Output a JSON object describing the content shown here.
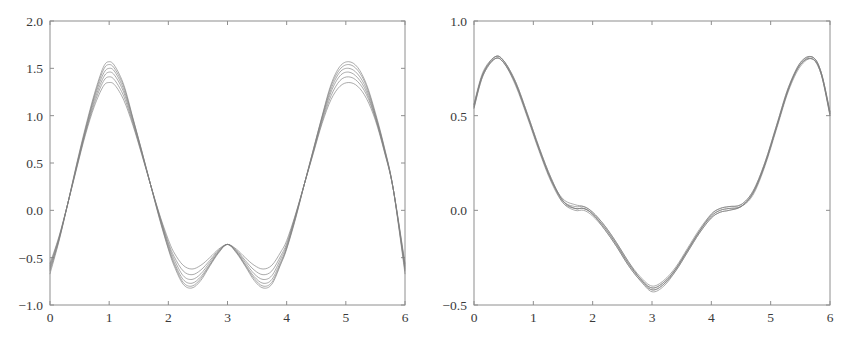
{
  "figure": {
    "background_color": "#ffffff",
    "curve_color": "#808080",
    "axis_color": "#8e8e8e",
    "tick_label_color": "#3a3a3a",
    "panel_count": 2
  },
  "chart_data": [
    {
      "type": "line",
      "title": "",
      "subtitle": "",
      "xlabel": "",
      "ylabel": "",
      "xlim": [
        0,
        6
      ],
      "ylim": [
        -1.0,
        2.0
      ],
      "xticks": [
        0,
        1,
        2,
        3,
        4,
        5,
        6
      ],
      "xtick_labels": [
        "0",
        "1",
        "2",
        "3",
        "4",
        "5",
        "6"
      ],
      "yticks": [
        -1.0,
        -0.5,
        0.0,
        0.5,
        1.0,
        1.5,
        2.0
      ],
      "ytick_labels": [
        "-1.0",
        "-0.5",
        "0.0",
        "0.5",
        "1.0",
        "1.5",
        "2.0"
      ],
      "grid": false,
      "legend": null,
      "legend_position": "none",
      "annotations": [],
      "x": [
        0.0,
        0.15,
        0.3,
        0.45,
        0.6,
        0.75,
        0.9,
        1.0,
        1.1,
        1.25,
        1.4,
        1.55,
        1.7,
        1.85,
        2.0,
        2.1,
        2.25,
        2.4,
        2.55,
        2.7,
        2.85,
        3.0,
        3.15,
        3.3,
        3.45,
        3.6,
        3.75,
        3.9,
        4.0,
        4.15,
        4.3,
        4.45,
        4.6,
        4.75,
        4.9,
        5.05,
        5.2,
        5.35,
        5.5,
        5.65,
        5.8,
        6.0
      ],
      "series": [
        {
          "name": "curve-1",
          "values": [
            -0.56,
            -0.28,
            0.07,
            0.44,
            0.8,
            1.1,
            1.31,
            1.35,
            1.32,
            1.16,
            0.9,
            0.59,
            0.27,
            -0.04,
            -0.31,
            -0.45,
            -0.58,
            -0.62,
            -0.58,
            -0.5,
            -0.41,
            -0.36,
            -0.41,
            -0.5,
            -0.58,
            -0.62,
            -0.58,
            -0.44,
            -0.32,
            -0.04,
            0.28,
            0.6,
            0.92,
            1.17,
            1.31,
            1.35,
            1.31,
            1.18,
            0.95,
            0.62,
            0.23,
            -0.56
          ]
        },
        {
          "name": "curve-2",
          "values": [
            -0.58,
            -0.29,
            0.07,
            0.45,
            0.82,
            1.13,
            1.36,
            1.41,
            1.37,
            1.2,
            0.92,
            0.6,
            0.27,
            -0.05,
            -0.34,
            -0.49,
            -0.64,
            -0.68,
            -0.63,
            -0.53,
            -0.42,
            -0.36,
            -0.42,
            -0.53,
            -0.63,
            -0.68,
            -0.64,
            -0.48,
            -0.35,
            -0.05,
            0.28,
            0.61,
            0.94,
            1.21,
            1.37,
            1.41,
            1.36,
            1.22,
            0.97,
            0.63,
            0.23,
            -0.58
          ]
        },
        {
          "name": "curve-3",
          "values": [
            -0.6,
            -0.3,
            0.07,
            0.46,
            0.83,
            1.16,
            1.4,
            1.46,
            1.42,
            1.24,
            0.94,
            0.61,
            0.27,
            -0.06,
            -0.36,
            -0.52,
            -0.69,
            -0.73,
            -0.67,
            -0.55,
            -0.43,
            -0.36,
            -0.43,
            -0.55,
            -0.67,
            -0.73,
            -0.69,
            -0.51,
            -0.37,
            -0.06,
            0.28,
            0.62,
            0.96,
            1.25,
            1.42,
            1.46,
            1.4,
            1.25,
            0.98,
            0.64,
            0.23,
            -0.6
          ]
        },
        {
          "name": "curve-4",
          "values": [
            -0.62,
            -0.31,
            0.07,
            0.47,
            0.85,
            1.19,
            1.44,
            1.5,
            1.46,
            1.27,
            0.96,
            0.62,
            0.27,
            -0.07,
            -0.38,
            -0.55,
            -0.73,
            -0.77,
            -0.7,
            -0.57,
            -0.44,
            -0.36,
            -0.44,
            -0.57,
            -0.7,
            -0.77,
            -0.73,
            -0.54,
            -0.39,
            -0.07,
            0.28,
            0.63,
            0.98,
            1.28,
            1.46,
            1.5,
            1.44,
            1.28,
            1.0,
            0.65,
            0.23,
            -0.62
          ]
        },
        {
          "name": "curve-5",
          "values": [
            -0.64,
            -0.32,
            0.07,
            0.48,
            0.86,
            1.21,
            1.48,
            1.54,
            1.49,
            1.3,
            0.97,
            0.63,
            0.27,
            -0.08,
            -0.4,
            -0.57,
            -0.76,
            -0.8,
            -0.72,
            -0.58,
            -0.44,
            -0.36,
            -0.44,
            -0.58,
            -0.72,
            -0.8,
            -0.76,
            -0.56,
            -0.4,
            -0.08,
            0.28,
            0.64,
            0.99,
            1.31,
            1.49,
            1.54,
            1.48,
            1.31,
            1.01,
            0.66,
            0.23,
            -0.64
          ]
        },
        {
          "name": "curve-6",
          "values": [
            -0.67,
            -0.33,
            0.07,
            0.49,
            0.88,
            1.23,
            1.51,
            1.57,
            1.52,
            1.32,
            0.98,
            0.63,
            0.27,
            -0.09,
            -0.41,
            -0.59,
            -0.78,
            -0.82,
            -0.74,
            -0.59,
            -0.45,
            -0.36,
            -0.45,
            -0.59,
            -0.74,
            -0.82,
            -0.78,
            -0.57,
            -0.41,
            -0.09,
            0.28,
            0.64,
            1.0,
            1.33,
            1.52,
            1.57,
            1.51,
            1.33,
            1.03,
            0.67,
            0.23,
            -0.67
          ]
        }
      ]
    },
    {
      "type": "line",
      "title": "",
      "subtitle": "",
      "xlabel": "",
      "ylabel": "",
      "xlim": [
        0,
        6
      ],
      "ylim": [
        -0.5,
        1.0
      ],
      "xticks": [
        0,
        1,
        2,
        3,
        4,
        5,
        6
      ],
      "xtick_labels": [
        "0",
        "1",
        "2",
        "3",
        "4",
        "5",
        "6"
      ],
      "yticks": [
        -0.5,
        0.0,
        0.5,
        1.0
      ],
      "ytick_labels": [
        "-0.5",
        "0.0",
        "0.5",
        "1.0"
      ],
      "grid": false,
      "legend": null,
      "legend_position": "none",
      "annotations": [],
      "x": [
        0.0,
        0.15,
        0.35,
        0.5,
        0.7,
        0.9,
        1.1,
        1.3,
        1.5,
        1.7,
        1.85,
        2.0,
        2.2,
        2.4,
        2.6,
        2.8,
        3.0,
        3.2,
        3.4,
        3.6,
        3.8,
        4.0,
        4.15,
        4.3,
        4.5,
        4.7,
        4.9,
        5.1,
        5.3,
        5.5,
        5.7,
        5.85,
        6.0
      ],
      "series": [
        {
          "name": "curve-1",
          "values": [
            0.54,
            0.71,
            0.8,
            0.78,
            0.67,
            0.5,
            0.32,
            0.16,
            0.05,
            0.01,
            0.01,
            -0.02,
            -0.09,
            -0.18,
            -0.28,
            -0.36,
            -0.41,
            -0.38,
            -0.31,
            -0.21,
            -0.11,
            -0.03,
            0.0,
            0.01,
            0.02,
            0.09,
            0.24,
            0.44,
            0.64,
            0.77,
            0.8,
            0.72,
            0.5
          ]
        },
        {
          "name": "curve-2",
          "values": [
            0.55,
            0.72,
            0.8,
            0.78,
            0.67,
            0.5,
            0.32,
            0.16,
            0.04,
            0.0,
            0.0,
            -0.03,
            -0.1,
            -0.19,
            -0.29,
            -0.37,
            -0.42,
            -0.39,
            -0.32,
            -0.22,
            -0.12,
            -0.04,
            -0.01,
            0.0,
            0.02,
            0.09,
            0.24,
            0.44,
            0.64,
            0.77,
            0.8,
            0.72,
            0.51
          ]
        },
        {
          "name": "curve-3",
          "values": [
            0.56,
            0.72,
            0.81,
            0.79,
            0.68,
            0.51,
            0.33,
            0.17,
            0.05,
            0.02,
            0.02,
            -0.01,
            -0.08,
            -0.17,
            -0.27,
            -0.35,
            -0.4,
            -0.37,
            -0.3,
            -0.2,
            -0.1,
            -0.02,
            0.01,
            0.02,
            0.03,
            0.1,
            0.25,
            0.45,
            0.65,
            0.78,
            0.81,
            0.73,
            0.52
          ]
        },
        {
          "name": "curve-4",
          "values": [
            0.54,
            0.71,
            0.8,
            0.78,
            0.66,
            0.49,
            0.31,
            0.15,
            0.04,
            0.01,
            0.01,
            -0.02,
            -0.09,
            -0.18,
            -0.28,
            -0.36,
            -0.42,
            -0.39,
            -0.31,
            -0.21,
            -0.11,
            -0.03,
            0.0,
            0.01,
            0.02,
            0.08,
            0.23,
            0.43,
            0.63,
            0.76,
            0.8,
            0.72,
            0.5
          ]
        },
        {
          "name": "curve-5",
          "values": [
            0.55,
            0.72,
            0.81,
            0.79,
            0.67,
            0.5,
            0.32,
            0.16,
            0.06,
            0.03,
            0.02,
            -0.01,
            -0.08,
            -0.17,
            -0.27,
            -0.36,
            -0.41,
            -0.38,
            -0.31,
            -0.21,
            -0.11,
            -0.02,
            0.01,
            0.02,
            0.03,
            0.1,
            0.25,
            0.45,
            0.65,
            0.77,
            0.81,
            0.73,
            0.51
          ]
        },
        {
          "name": "curve-6",
          "values": [
            0.56,
            0.73,
            0.81,
            0.79,
            0.68,
            0.51,
            0.33,
            0.17,
            0.05,
            0.01,
            0.01,
            -0.02,
            -0.1,
            -0.19,
            -0.29,
            -0.37,
            -0.43,
            -0.4,
            -0.32,
            -0.22,
            -0.12,
            -0.04,
            -0.01,
            0.0,
            0.02,
            0.09,
            0.24,
            0.44,
            0.64,
            0.78,
            0.81,
            0.73,
            0.52
          ]
        }
      ]
    }
  ],
  "panels": [
    {
      "name": "left-plot",
      "frame": {
        "left": 50,
        "right": 405,
        "top": 21,
        "bottom": 305
      }
    },
    {
      "name": "right-plot",
      "frame": {
        "left": 474,
        "right": 830,
        "top": 21,
        "bottom": 305
      }
    }
  ]
}
